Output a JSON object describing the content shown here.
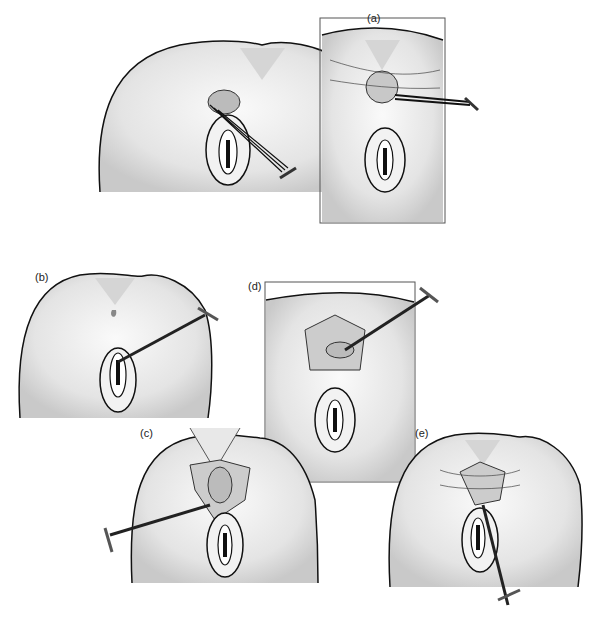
{
  "figure": {
    "panels": [
      {
        "id": "a",
        "label": "(a)"
      },
      {
        "id": "b",
        "label": "(b)"
      },
      {
        "id": "c",
        "label": "(c)"
      },
      {
        "id": "d",
        "label": "(d)"
      },
      {
        "id": "e",
        "label": "(e)"
      }
    ]
  }
}
